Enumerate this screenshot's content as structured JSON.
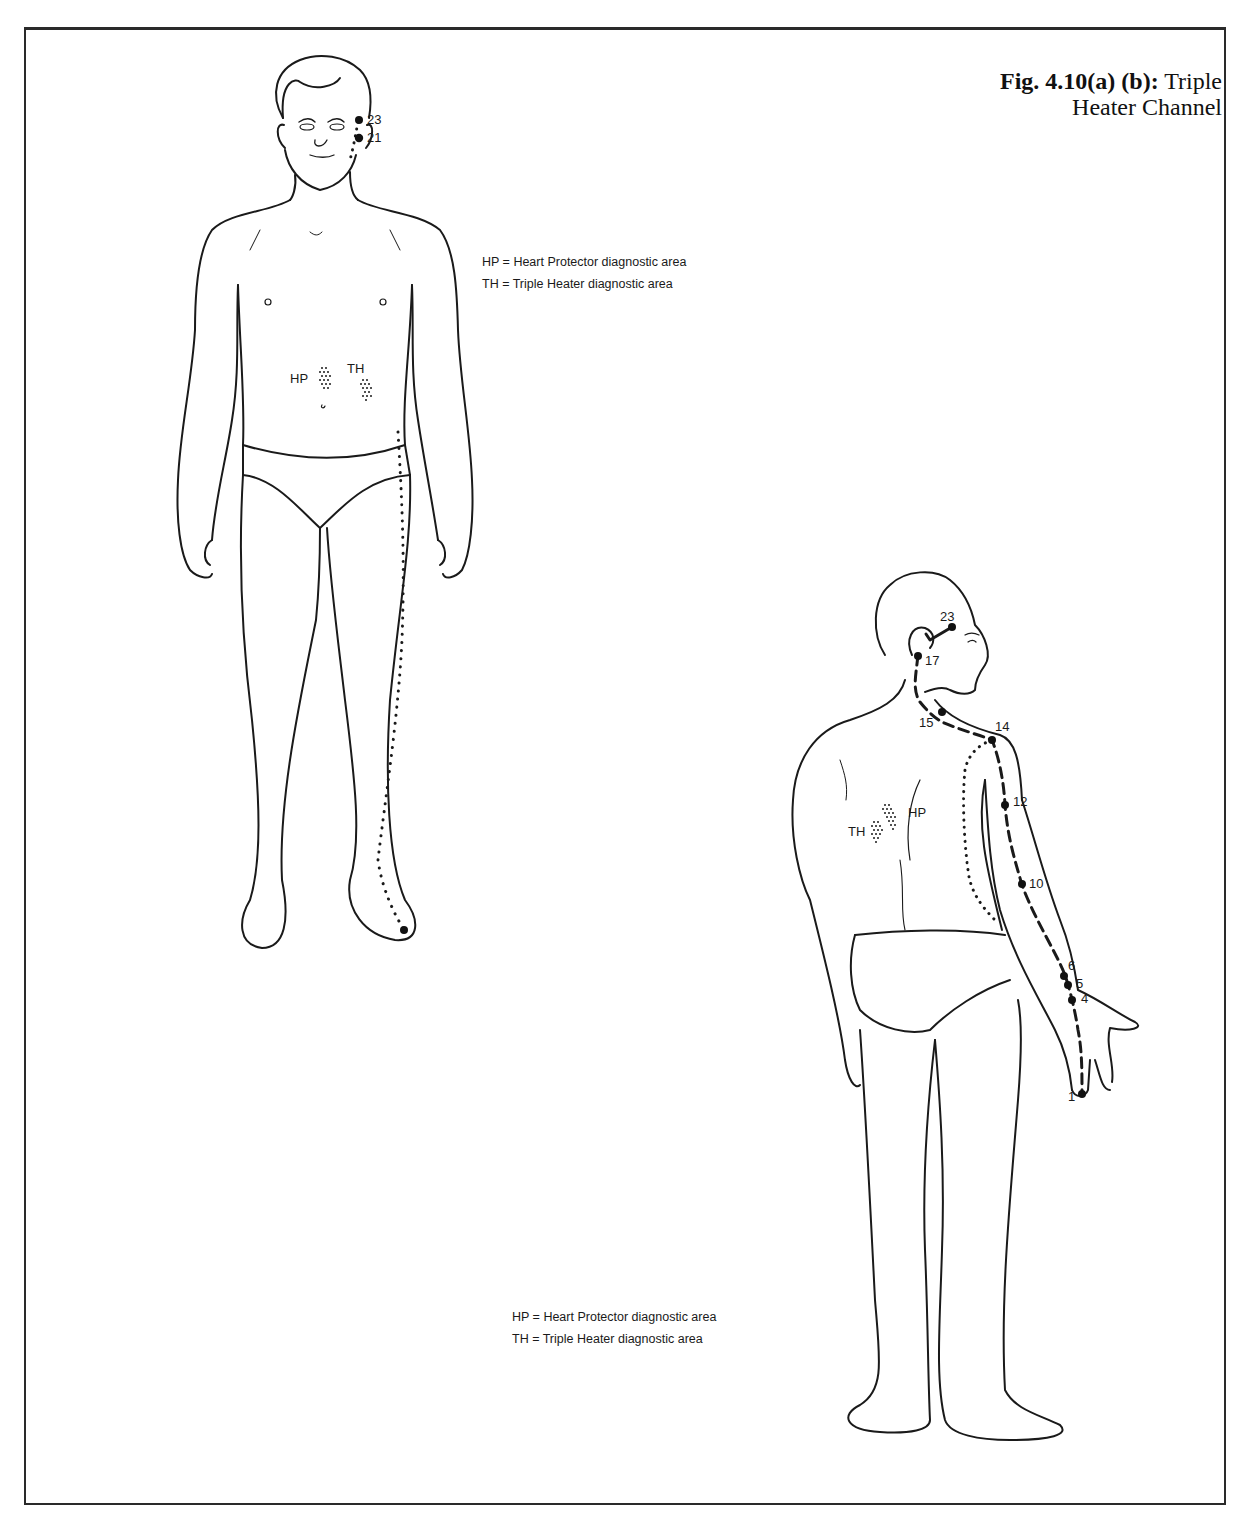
{
  "figure": {
    "title_bold": "Fig. 4.10(a) (b):",
    "title_rest": "Triple Heater Channel"
  },
  "figure_a": {
    "view": "front",
    "legend": [
      "HP = Heart Protector diagnostic area",
      "TH = Triple Heater diagnostic area"
    ],
    "area_labels": {
      "hp": "HP",
      "th": "TH"
    },
    "points": [
      {
        "id": "23",
        "label": "23"
      },
      {
        "id": "21",
        "label": "21"
      }
    ]
  },
  "figure_b": {
    "view": "back",
    "legend": [
      "HP = Heart Protector diagnostic area",
      "TH = Triple Heater diagnostic area"
    ],
    "area_labels": {
      "hp": "HP",
      "th": "TH"
    },
    "points": [
      {
        "id": "23",
        "label": "23"
      },
      {
        "id": "17",
        "label": "17"
      },
      {
        "id": "15",
        "label": "15"
      },
      {
        "id": "14",
        "label": "14"
      },
      {
        "id": "12",
        "label": "12"
      },
      {
        "id": "10",
        "label": "10"
      },
      {
        "id": "6",
        "label": "6"
      },
      {
        "id": "5",
        "label": "5"
      },
      {
        "id": "4",
        "label": "4"
      },
      {
        "id": "1",
        "label": "1"
      }
    ]
  },
  "colors": {
    "ink": "#1a1a1a",
    "paper": "#ffffff"
  }
}
